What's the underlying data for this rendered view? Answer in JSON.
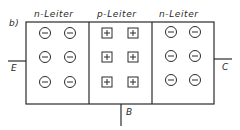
{
  "figure": {
    "label": "b)",
    "regions": [
      {
        "name": "n-Leiter",
        "type": "n",
        "carrier_symbol": "minus-circle",
        "rows": 3,
        "cols": 2
      },
      {
        "name": "p-Leiter",
        "type": "p",
        "carrier_symbol": "plus-square",
        "rows": 3,
        "cols": 2
      },
      {
        "name": "n-Leiter",
        "type": "n",
        "carrier_symbol": "minus-circle",
        "rows": 3,
        "cols": 2
      }
    ],
    "terminals": {
      "emitter": "E",
      "collector": "C",
      "base": "B"
    },
    "colors": {
      "line": "#2a2a2a",
      "background": "#ffffff"
    }
  }
}
